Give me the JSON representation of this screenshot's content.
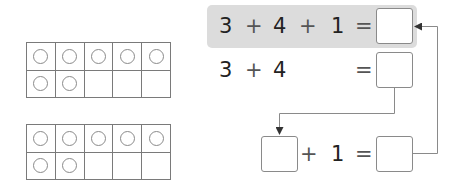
{
  "ten_frames": [
    {
      "filled": 7,
      "total": 10
    },
    {
      "filled": 7,
      "total": 10
    }
  ],
  "equations": {
    "row1": {
      "a": "3",
      "op1": "+",
      "b": "4",
      "op2": "+",
      "c": "1",
      "eq": "=",
      "answer": ""
    },
    "row2": {
      "a": "3",
      "op1": "+",
      "b": "4",
      "eq": "=",
      "answer": ""
    },
    "row3": {
      "a": "",
      "op1": "+",
      "b": "1",
      "eq": "=",
      "answer": ""
    }
  },
  "colors": {
    "highlight": "#dcdcdc",
    "lines": "#8a8a8a",
    "text": "#222222"
  }
}
